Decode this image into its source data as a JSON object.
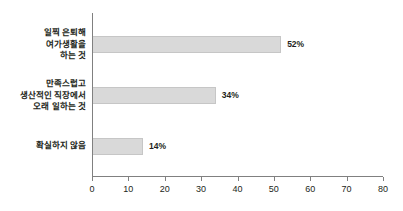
{
  "chart_data": {
    "type": "bar",
    "orientation": "horizontal",
    "title": "",
    "subtitle": "",
    "xlabel": "",
    "ylabel": "",
    "xlim": [
      0,
      80
    ],
    "grid": false,
    "legend": "none",
    "categories": [
      "일찍 은퇴해\n여가생활을\n하는 것",
      "만족스럽고\n생산적인 직장에서\n오래 일하는 것",
      "확실하지 않음"
    ],
    "values": [
      52,
      34,
      14
    ],
    "value_labels": [
      "52%",
      "34%",
      "14%"
    ],
    "xticks": [
      0,
      10,
      20,
      30,
      40,
      50,
      60,
      70,
      80
    ],
    "xtick_labels": [
      "0",
      "10",
      "20",
      "30",
      "40",
      "50",
      "60",
      "70",
      "80"
    ],
    "colors": {
      "bar_fill": "#d9d9d9",
      "bar_border": "#c6c6c6",
      "axis": "#808080",
      "text": "#231f20",
      "background": "#ffffff"
    }
  },
  "bars": [
    {
      "label": "일찍 은퇴해\n여가생활을\n하는 것",
      "value": 52,
      "value_label": "52%"
    },
    {
      "label": "만족스럽고\n생산적인 직장에서\n오래 일하는 것",
      "value": 34,
      "value_label": "34%"
    },
    {
      "label": "확실하지 않음",
      "value": 14,
      "value_label": "14%"
    }
  ],
  "axis": {
    "ticks": [
      {
        "label": "0"
      },
      {
        "label": "10"
      },
      {
        "label": "20"
      },
      {
        "label": "30"
      },
      {
        "label": "40"
      },
      {
        "label": "50"
      },
      {
        "label": "60"
      },
      {
        "label": "70"
      },
      {
        "label": "80"
      }
    ]
  }
}
